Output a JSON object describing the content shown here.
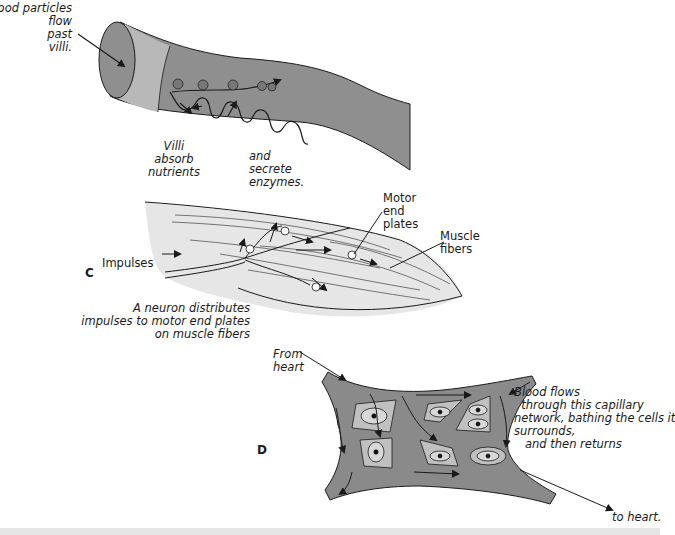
{
  "panels": {
    "B": {
      "title": "Small intestine villi",
      "labels": {
        "food": "Food particles\nflow\npast\nvilli.",
        "absorb": "Villi\nabsorb\nnutrients",
        "secrete": "and\nsecrete\nenzymes."
      }
    },
    "C": {
      "letter": "C",
      "labels": {
        "impulses": "Impulses",
        "motor": "Motor\nend\nplates",
        "muscle": "Muscle\nfibers",
        "caption": "A neuron distributes\nimpulses to motor end plates\non muscle fibers"
      }
    },
    "D": {
      "letter": "D",
      "labels": {
        "from": "From\nheart",
        "blood": "Blood flows\n  through this capillary\nnetwork, bathing the cells it\nsurrounds,\n   and then returns",
        "to": "to heart."
      }
    }
  },
  "colors": {
    "tissue_dark": "#8a8a8a",
    "tissue_mid": "#a8a8a8",
    "tissue_light": "#c4c4c4",
    "muscle_fill": "#e4e4e4",
    "outline": "#1a1a1a",
    "cell_fill": "#bdbdbd"
  }
}
